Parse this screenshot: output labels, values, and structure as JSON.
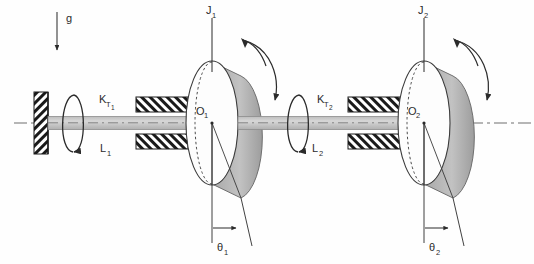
{
  "figure": {
    "type": "engineering-diagram",
    "background_color": "#fefefe",
    "line_color": "#2b2b2b",
    "disk_rim_color": "#b9b9b9",
    "shaft_color": "#c9c9c9",
    "hatch_color": "#1a1a1a"
  },
  "labels": {
    "gravity": "g",
    "inertia_1": "J",
    "inertia_1_sub": "1",
    "inertia_2": "J",
    "inertia_2_sub": "2",
    "center_1": "O",
    "center_1_sub": "1",
    "center_2": "O",
    "center_2_sub": "2",
    "stiffness_1": "K",
    "stiffness_1_sub": "T",
    "stiffness_1_sub2": "1",
    "stiffness_2": "K",
    "stiffness_2_sub": "T",
    "stiffness_2_sub2": "2",
    "length_1": "L",
    "length_1_sub": "1",
    "length_2": "L",
    "length_2_sub": "2",
    "angle_1": "θ",
    "angle_1_sub": "1",
    "angle_2": "θ",
    "angle_2_sub": "2"
  },
  "components": {
    "fixed_wall": "fixed-wall-support",
    "bearing_1": "bearing-block-1",
    "bearing_2": "bearing-block-2",
    "shaft_segment_1": "shaft-segment-1",
    "shaft_segment_2": "shaft-segment-2",
    "disk_1": "disk-1",
    "disk_2": "disk-2",
    "centerline": "axis-centerline",
    "torsion_arrow_wall": "torsion-arrow-at-wall",
    "torsion_arrow_mid": "torsion-arrow-mid-shaft",
    "rotation_arrow_1": "rotation-arrow-disk-1",
    "rotation_arrow_2": "rotation-arrow-disk-2",
    "gravity_arrow": "gravity-arrow"
  }
}
